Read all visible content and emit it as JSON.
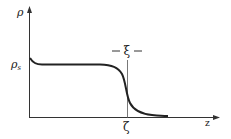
{
  "diagram": {
    "type": "density-profile",
    "y_axis": {
      "label": "ρ"
    },
    "x_axis": {
      "label": "z"
    },
    "reference_level": {
      "label": "ρ",
      "subscript": "s"
    },
    "interface_position": {
      "label": "ζ"
    },
    "interface_width": {
      "label": "ξ",
      "left_dash": "–",
      "right_dash": "–"
    },
    "colors": {
      "ink": "#222222",
      "background": "#ffffff"
    }
  }
}
